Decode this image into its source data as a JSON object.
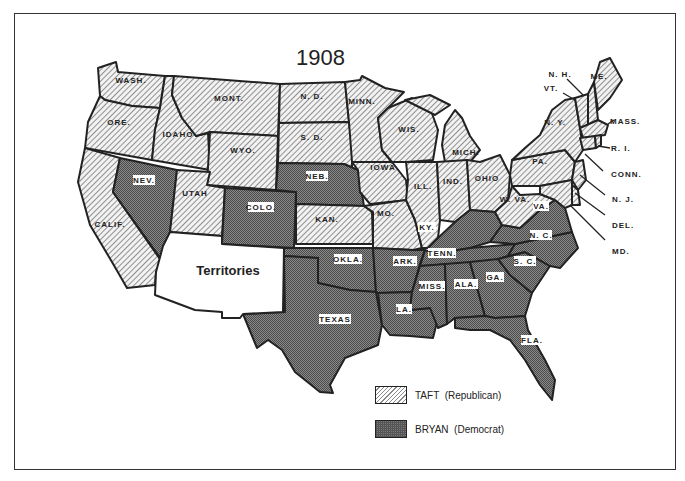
{
  "map": {
    "title": "1908",
    "colors": {
      "taft_fill": "#d9d9d9",
      "bryan_fill": "#6e6e6e",
      "territories_fill": "#ffffff",
      "border": "#222222"
    },
    "territories_label": "Territories",
    "states": {
      "wash": "WASH.",
      "ore": "ORE.",
      "calif": "CALIF.",
      "idaho": "IDAHO",
      "nev": "NEV.",
      "mont": "MONT.",
      "wyo": "WYO.",
      "utah": "UTAH",
      "colo": "COLO.",
      "nd": "N. D.",
      "sd": "S. D.",
      "neb": "NEB.",
      "kan": "KAN.",
      "okla": "OKLA.",
      "texas": "TEXAS",
      "minn": "MINN.",
      "iowa": "IOWA",
      "mo": "MO.",
      "ark": "ARK.",
      "la": "LA.",
      "wis": "WIS.",
      "ill": "ILL.",
      "mich": "MICH.",
      "ind": "IND.",
      "ohio": "OHIO",
      "ky": "KY.",
      "tenn": "TENN.",
      "miss": "MISS.",
      "ala": "ALA.",
      "ga": "GA.",
      "fla": "FLA.",
      "wva": "W. VA.",
      "va": "VA.",
      "nc": "N. C.",
      "sc": "S. C.",
      "pa": "PA.",
      "ny": "N. Y.",
      "me": "ME.",
      "nh": "N. H.",
      "vt": "VT.",
      "mass": "MASS.",
      "ri": "R. I.",
      "conn": "CONN.",
      "nj": "N. J.",
      "del": "DEL.",
      "md": "MD."
    },
    "results": {
      "taft": [
        "WASH.",
        "ORE.",
        "CALIF.",
        "IDAHO",
        "MONT.",
        "WYO.",
        "UTAH",
        "N. D.",
        "S. D.",
        "KAN.",
        "MINN.",
        "IOWA",
        "MO.",
        "WIS.",
        "ILL.",
        "MICH.",
        "IND.",
        "OHIO",
        "W. VA.",
        "PA.",
        "N. Y.",
        "ME.",
        "N. H.",
        "VT.",
        "MASS.",
        "R. I.",
        "CONN.",
        "N. J.",
        "DEL.",
        "MD."
      ],
      "bryan": [
        "NEV.",
        "COLO.",
        "NEB.",
        "OKLA.",
        "TEXAS",
        "ARK.",
        "LA.",
        "KY.",
        "TENN.",
        "MISS.",
        "ALA.",
        "GA.",
        "FLA.",
        "VA.",
        "N. C.",
        "S. C."
      ]
    }
  },
  "legend": {
    "items": [
      {
        "label": "TAFT  (Republican)",
        "pattern": "diagonal-hatch"
      },
      {
        "label": "BRYAN  (Democrat)",
        "pattern": "crosshatch-dark"
      }
    ]
  }
}
